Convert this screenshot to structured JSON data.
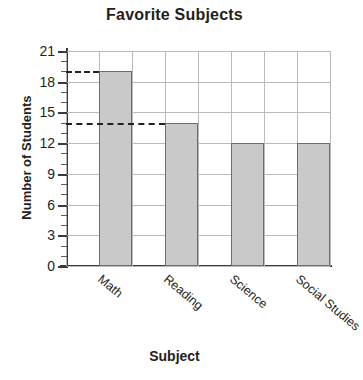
{
  "chart_data": {
    "type": "bar",
    "title": "Favorite Subjects",
    "xlabel": "Subject",
    "ylabel": "Number of Students",
    "categories": [
      "Math",
      "Reading",
      "Science",
      "Social Studies"
    ],
    "values": [
      19,
      14,
      12,
      12
    ],
    "ylim": [
      0,
      21
    ],
    "ytick_labels": [
      "0",
      "3",
      "6",
      "9",
      "12",
      "15",
      "18",
      "21"
    ],
    "ytick_values": [
      0,
      3,
      6,
      9,
      12,
      15,
      18,
      21
    ],
    "minor_tick_interval": 1,
    "grid": true,
    "legend": null,
    "annotations": [
      {
        "kind": "dashed-leader",
        "value": 19,
        "from_axis_to": "Math"
      },
      {
        "kind": "dashed-leader",
        "value": 14,
        "from_axis_to": "Reading"
      }
    ],
    "colors": {
      "bar_fill": "#c9c9c9",
      "bar_edge": "#6d6d6d",
      "grid": "#b9b9b9",
      "axis": "#3a3a3a",
      "text": "#231f20",
      "background": "#ffffff"
    }
  }
}
